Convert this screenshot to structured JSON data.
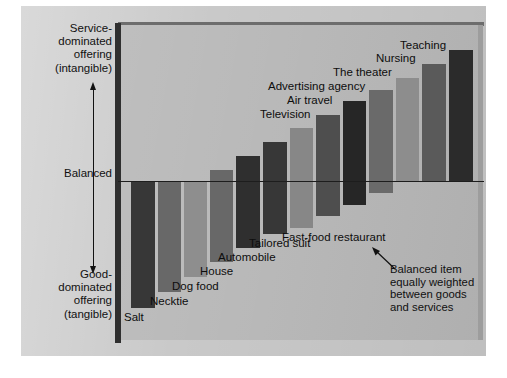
{
  "chart_data": {
    "type": "bar",
    "title": "",
    "subtitle": "",
    "xlabel": "",
    "ylabel": "Service-dominated offering (intangible) to Good-dominated offering (tangible)",
    "orientation": "vertical",
    "grid": false,
    "legend": "none",
    "baseline_label": "Balanced",
    "baseline_value": 0,
    "ylim": [
      -100,
      100
    ],
    "axis_labels": {
      "top": "Service-\ndominated\noffering\n(intangible)",
      "middle": "Balanced",
      "bottom": "Good-\ndominated\noffering\n(tangible)"
    },
    "annotation": {
      "text": "Balanced item\nequally weighted\nbetween goods\nand services",
      "points_to": "Fast-food restaurant"
    },
    "categories": [
      "Salt",
      "Necktie",
      "Dog food",
      "House",
      "Automobile",
      "Tailored suit",
      "Fast-food restaurant",
      "Television",
      "Air travel",
      "Advertising agency",
      "The theater",
      "Nursing",
      "Teaching"
    ],
    "values": [
      -80,
      -69,
      -57,
      -44,
      -25,
      -12,
      0,
      14,
      26,
      38,
      52,
      70,
      82
    ],
    "bar_colors": [
      "#373737",
      "#686868",
      "#8e8e8e",
      "#686868",
      "#2f2f2f",
      "#4f4f4f",
      "#878787",
      "#3a3a3a",
      "#6a6a6a",
      "#2a2a2a",
      "#6f6f6f",
      "#8d8d8d",
      "#5a5a5a",
      "#2b2b2b"
    ]
  },
  "bars": [
    {
      "label": "Salt",
      "x": 131,
      "top": 182,
      "bottom": 308,
      "width": 24,
      "color": "#373737",
      "label_x": 124,
      "label_y": 311
    },
    {
      "label": "Necktie",
      "x": 158,
      "top": 182,
      "bottom": 292,
      "width": 23,
      "color": "#686868",
      "label_x": 150,
      "label_y": 295
    },
    {
      "label": "Dog food",
      "x": 184,
      "top": 182,
      "bottom": 277,
      "width": 23,
      "color": "#8e8e8e",
      "label_x": 172,
      "label_y": 280
    },
    {
      "label": "House",
      "x": 210,
      "top": 170,
      "bottom": 262,
      "width": 23,
      "color": "#686868",
      "label_x": 200,
      "label_y": 265
    },
    {
      "label": "Automobile",
      "x": 236,
      "top": 156,
      "bottom": 248,
      "width": 24,
      "color": "#2f2f2f",
      "label_x": 218,
      "label_y": 251
    },
    {
      "label": "Tailored suit",
      "x": 263,
      "top": 142,
      "bottom": 234,
      "width": 24,
      "color": "#373737",
      "label_x": 249,
      "label_y": 237
    },
    {
      "label": "Fast-food restaurant",
      "x": 290,
      "top": 128,
      "bottom": 228,
      "width": 23,
      "color": "#878787",
      "label_x": 282,
      "label_y": 231
    },
    {
      "label": "Television",
      "x": 316,
      "top": 115,
      "bottom": 216,
      "width": 24,
      "color": "#4e4e4e",
      "label_x": 260,
      "label_y": 108
    },
    {
      "label": "Air travel",
      "x": 343,
      "top": 101,
      "bottom": 205,
      "width": 23,
      "color": "#262626",
      "label_x": 287,
      "label_y": 94
    },
    {
      "label": "Advertising agency",
      "x": 369,
      "top": 90,
      "bottom": 193,
      "width": 24,
      "color": "#6a6a6a",
      "label_x": 268,
      "label_y": 80
    },
    {
      "label": "The theater",
      "x": 396,
      "top": 78,
      "bottom": 182,
      "width": 23,
      "color": "#8d8d8d",
      "label_x": 333,
      "label_y": 66
    },
    {
      "label": "Nursing",
      "x": 422,
      "top": 64,
      "bottom": 182,
      "width": 24,
      "color": "#5a5a5a",
      "label_x": 376,
      "label_y": 52
    },
    {
      "label": "Teaching",
      "x": 449,
      "top": 50,
      "bottom": 182,
      "width": 24,
      "color": "#2b2b2b",
      "label_x": 400,
      "label_y": 39
    }
  ],
  "colors": {
    "plot_background": "#b7b7b7",
    "page_background": "#c9c9c9",
    "baseline": "#1d1d1d",
    "text": "#111111"
  }
}
